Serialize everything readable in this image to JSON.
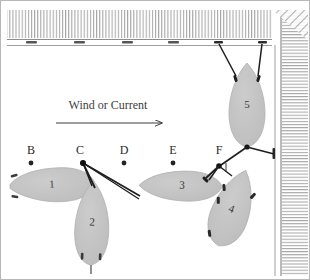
{
  "diagram": {
    "title": "Wind or Current",
    "flow": {
      "label": "Wind or Current",
      "arrow_direction": "right"
    },
    "colors": {
      "boat_fill": "#c3c3c3",
      "boat_stroke": "#a9a9a9",
      "line": "#1d1d1d",
      "hatch": "#9a9a9a",
      "dock_edge": "#6e6e6e",
      "text": "#2b2b2b",
      "background": "#ffffff"
    },
    "stations": [
      {
        "label": "B",
        "x": 31,
        "y": 163,
        "text_x": 31,
        "text_y": 153
      },
      {
        "label": "C",
        "x": 83,
        "y": 163,
        "text_x": 80,
        "text_y": 153
      },
      {
        "label": "D",
        "x": 124,
        "y": 163,
        "text_x": 124,
        "text_y": 153
      },
      {
        "label": "E",
        "x": 173,
        "y": 163,
        "text_x": 173,
        "text_y": 153
      },
      {
        "label": "F",
        "x": 220,
        "y": 163,
        "text_x": 219,
        "text_y": 153
      }
    ],
    "boats": [
      {
        "id": "1",
        "label": "1",
        "cx": 52,
        "cy": 185,
        "rx": 42,
        "ry": 16,
        "rotation": -2
      },
      {
        "id": "2",
        "label": "2",
        "cx": 92,
        "cy": 223,
        "rx": 16,
        "ry": 40,
        "rotation": 2
      },
      {
        "id": "3",
        "label": "3",
        "cx": 180,
        "cy": 186,
        "rx": 40,
        "ry": 15,
        "rotation": 1
      },
      {
        "id": "4",
        "label": "4",
        "cx": 232,
        "cy": 208,
        "rx": 18,
        "ry": 38,
        "rotation": 20
      },
      {
        "id": "5",
        "label": "5",
        "cx": 247,
        "cy": 105,
        "rx": 18,
        "ry": 40,
        "rotation": 0
      }
    ],
    "dock": {
      "top_edge_label": "top-dock",
      "right_edge_label": "right-seawall",
      "cleat_count_top": 6
    },
    "mooring_lines": [
      {
        "from": "C",
        "to": "boat-3-bow"
      },
      {
        "from": "C",
        "to": "boat-2-bow"
      },
      {
        "from": "boat-5-bow-port",
        "to": "dock-cleat-5"
      },
      {
        "from": "boat-5-bow-starboard",
        "to": "dock-cleat-6"
      },
      {
        "from": "boat-5-stern",
        "to": "F"
      },
      {
        "from": "boat-5-stern",
        "to": "seawall-cleat"
      }
    ]
  }
}
